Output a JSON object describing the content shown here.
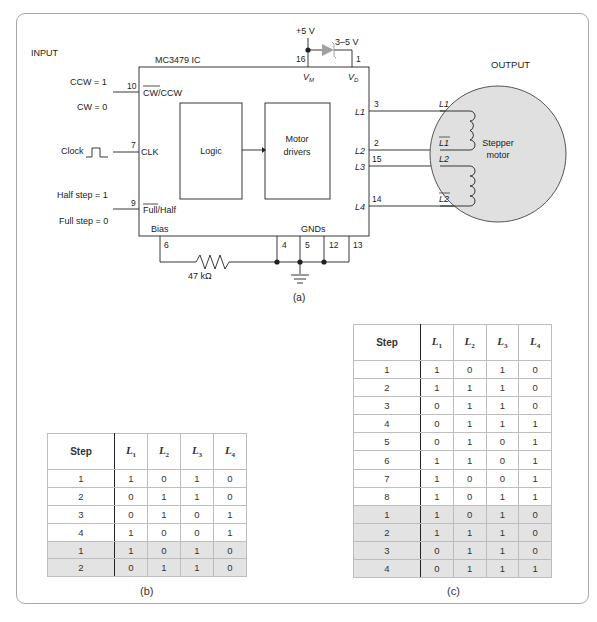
{
  "figure": {
    "panel_a_caption": "(a)",
    "panel_b_caption": "(b)",
    "panel_c_caption": "(c)"
  },
  "schematic": {
    "input_label": "INPUT",
    "output_label": "OUTPUT",
    "ic_name": "MC3479 IC",
    "supply_label": "+5 V",
    "diode_label": "3–5 V",
    "vm_label": "V",
    "vm_sub": "M",
    "vd_label": "V",
    "vd_sub": "D",
    "pin16": "16",
    "pin1": "1",
    "logic_block": "Logic",
    "driver_block_line1": "Motor",
    "driver_block_line2": "drivers",
    "inputs": {
      "dir_high": "CCW = 1",
      "dir_low": "CW = 0",
      "dir_pin": "10",
      "dir_pin_label": "CW/CCW",
      "clock_label": "Clock",
      "clock_pin": "7",
      "clock_pin_label": "CLK",
      "half_label": "Half step = 1",
      "full_label": "Full step = 0",
      "mode_pin": "9",
      "mode_pin_label": "Full/Half"
    },
    "bias_label": "Bias",
    "bias_pin": "6",
    "resistor_label": "47 kΩ",
    "gnds_label": "GNDs",
    "gnd_pins": [
      "4",
      "5",
      "12",
      "13"
    ],
    "outputs": [
      {
        "pin": "3",
        "ic_label": "L1",
        "coil_label": "L1"
      },
      {
        "pin": "2",
        "ic_label": "L2",
        "coil_label": "L1 (bar)"
      },
      {
        "pin": "15",
        "ic_label": "L3",
        "coil_label": "L2"
      },
      {
        "pin": "14",
        "ic_label": "L4",
        "coil_label": "L2 (bar)"
      }
    ],
    "motor_line1": "Stepper",
    "motor_line2": "motor"
  },
  "table_b": {
    "headers": [
      "Step",
      "L1",
      "L2",
      "L3",
      "L4"
    ],
    "rows": [
      {
        "step": "1",
        "l1": "1",
        "l2": "0",
        "l3": "1",
        "l4": "0",
        "shaded": false
      },
      {
        "step": "2",
        "l1": "0",
        "l2": "1",
        "l3": "1",
        "l4": "0",
        "shaded": false
      },
      {
        "step": "3",
        "l1": "0",
        "l2": "1",
        "l3": "0",
        "l4": "1",
        "shaded": false
      },
      {
        "step": "4",
        "l1": "1",
        "l2": "0",
        "l3": "0",
        "l4": "1",
        "shaded": false
      },
      {
        "step": "1",
        "l1": "1",
        "l2": "0",
        "l3": "1",
        "l4": "0",
        "shaded": true
      },
      {
        "step": "2",
        "l1": "0",
        "l2": "1",
        "l3": "1",
        "l4": "0",
        "shaded": true
      }
    ]
  },
  "table_c": {
    "headers": [
      "Step",
      "L1",
      "L2",
      "L3",
      "L4"
    ],
    "rows": [
      {
        "step": "1",
        "l1": "1",
        "l2": "0",
        "l3": "1",
        "l4": "0",
        "shaded": false
      },
      {
        "step": "2",
        "l1": "1",
        "l2": "1",
        "l3": "1",
        "l4": "0",
        "shaded": false
      },
      {
        "step": "3",
        "l1": "0",
        "l2": "1",
        "l3": "1",
        "l4": "0",
        "shaded": false
      },
      {
        "step": "4",
        "l1": "0",
        "l2": "1",
        "l3": "1",
        "l4": "1",
        "shaded": false
      },
      {
        "step": "5",
        "l1": "0",
        "l2": "1",
        "l3": "0",
        "l4": "1",
        "shaded": false
      },
      {
        "step": "6",
        "l1": "1",
        "l2": "1",
        "l3": "0",
        "l4": "1",
        "shaded": false
      },
      {
        "step": "7",
        "l1": "1",
        "l2": "0",
        "l3": "0",
        "l4": "1",
        "shaded": false
      },
      {
        "step": "8",
        "l1": "1",
        "l2": "0",
        "l3": "1",
        "l4": "1",
        "shaded": false
      },
      {
        "step": "1",
        "l1": "1",
        "l2": "0",
        "l3": "1",
        "l4": "0",
        "shaded": true
      },
      {
        "step": "2",
        "l1": "1",
        "l2": "1",
        "l3": "1",
        "l4": "0",
        "shaded": true
      },
      {
        "step": "3",
        "l1": "0",
        "l2": "1",
        "l3": "1",
        "l4": "0",
        "shaded": true
      },
      {
        "step": "4",
        "l1": "0",
        "l2": "1",
        "l3": "1",
        "l4": "1",
        "shaded": true
      }
    ]
  },
  "colors": {
    "frame_border": "#a8a8a8",
    "motor_fill": "#e0e0e0",
    "diode_fill": "#a0a0a0",
    "shaded_row": "#e3e3e3",
    "line": "#222222"
  }
}
